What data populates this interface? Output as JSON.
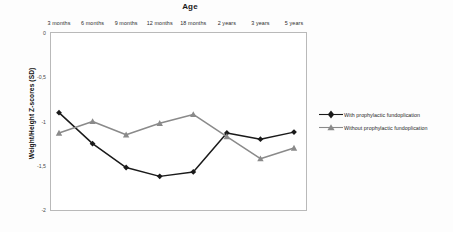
{
  "chart_data": {
    "type": "line",
    "title": "Age",
    "xlabel": "Age",
    "ylabel": "Weight/Height Z-scores (SD)",
    "categories": [
      "3 months",
      "6 months",
      "9 months",
      "12 months",
      "18 months",
      "2 years",
      "3 years",
      "5 years"
    ],
    "ylim": [
      -2,
      0
    ],
    "yticks": [
      "0",
      "-0,5",
      "-1",
      "-1,5",
      "-2"
    ],
    "ytick_values": [
      0,
      -0.5,
      -1,
      -1.5,
      -2
    ],
    "grid": false,
    "legend_position": "right",
    "series": [
      {
        "name": "With prophylactic fundoplication",
        "color": "#1a1a1a",
        "marker": "diamond",
        "values": [
          -0.9,
          -1.25,
          -1.52,
          -1.62,
          -1.57,
          -1.13,
          -1.2,
          -1.12
        ]
      },
      {
        "name": "Without prophylactic fundoplication",
        "color": "#8a8a8a",
        "marker": "triangle",
        "values": [
          -1.13,
          -1.0,
          -1.15,
          -1.02,
          -0.92,
          -1.17,
          -1.42,
          -1.3
        ]
      }
    ]
  },
  "legend": {
    "items": [
      {
        "label": "With prophylactic fundoplication"
      },
      {
        "label": "Without prophylactic fundoplication"
      }
    ]
  }
}
